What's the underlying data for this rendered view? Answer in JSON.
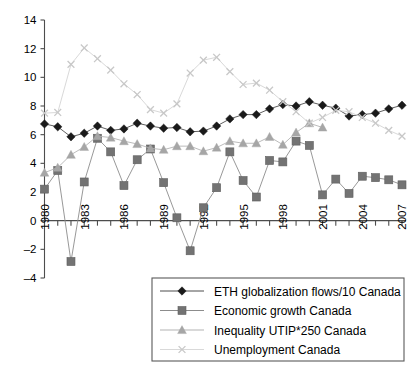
{
  "chart_data": {
    "type": "line",
    "title": "",
    "subtitle": "",
    "xlabel": "",
    "ylabel": "",
    "xlim": [
      1980,
      2007
    ],
    "ylim": [
      -4,
      14
    ],
    "ytick_step": 2,
    "grid": false,
    "legend_position": "bottom-right",
    "yticks": [
      "14",
      "12",
      "10",
      "8",
      "6",
      "4",
      "2",
      "0",
      "–2",
      "–4"
    ],
    "ytick_values": [
      14,
      12,
      10,
      8,
      6,
      4,
      2,
      0,
      -2,
      -4
    ],
    "x": [
      1980,
      1981,
      1982,
      1983,
      1984,
      1985,
      1986,
      1987,
      1988,
      1989,
      1990,
      1991,
      1992,
      1993,
      1994,
      1995,
      1996,
      1997,
      1998,
      1999,
      2000,
      2001,
      2002,
      2003,
      2004,
      2005,
      2006,
      2007
    ],
    "xticks": [
      "1980",
      "1983",
      "1986",
      "1989",
      "1992",
      "1995",
      "1998",
      "2001",
      "2004",
      "2007"
    ],
    "xtick_values": [
      1980,
      1983,
      1986,
      1989,
      1992,
      1995,
      1998,
      2001,
      2004,
      2007
    ],
    "series": [
      {
        "name": "ETH globalization flows/10 Canada",
        "marker": "diamond",
        "color": "#1a1a1a",
        "line_color": "#4d4d4d",
        "values": [
          6.75,
          6.55,
          5.85,
          6.1,
          6.6,
          6.3,
          6.4,
          6.8,
          6.6,
          6.45,
          6.5,
          6.2,
          6.25,
          6.6,
          7.1,
          7.4,
          7.4,
          7.8,
          8.1,
          8.0,
          8.3,
          8.05,
          7.85,
          7.3,
          7.4,
          7.5,
          7.8,
          8.05
        ]
      },
      {
        "name": "Economic growth Canada",
        "marker": "square",
        "color": "#737373",
        "line_color": "#8c8c8c",
        "values": [
          2.2,
          3.5,
          -2.85,
          2.7,
          5.75,
          4.8,
          2.45,
          4.25,
          5.0,
          2.65,
          0.2,
          -2.1,
          0.9,
          2.3,
          4.8,
          2.8,
          1.65,
          4.2,
          4.1,
          5.55,
          5.25,
          1.8,
          2.9,
          1.9,
          3.1,
          3.0,
          2.85,
          2.5
        ]
      },
      {
        "name": "Inequality UTIP*250 Canada",
        "marker": "triangle",
        "color": "#a6a6a6",
        "line_color": "#b3b3b3",
        "values": [
          3.35,
          3.7,
          4.6,
          5.15,
          5.9,
          5.8,
          5.55,
          5.35,
          5.05,
          4.95,
          5.2,
          5.2,
          4.85,
          5.1,
          5.55,
          5.4,
          5.4,
          5.85,
          5.3,
          6.15,
          6.8,
          6.5,
          null,
          null,
          null,
          null,
          null,
          null
        ]
      },
      {
        "name": "Unemployment Canada",
        "marker": "cross",
        "color": "#d9d9d9",
        "line_color": "#d9d9d9",
        "values": [
          7.5,
          7.55,
          10.9,
          12.05,
          11.3,
          10.5,
          9.55,
          8.8,
          7.75,
          7.5,
          8.15,
          10.3,
          11.2,
          11.4,
          10.4,
          9.5,
          9.6,
          9.1,
          8.3,
          7.6,
          6.8,
          7.2,
          7.7,
          7.6,
          7.2,
          6.8,
          6.3,
          5.9
        ]
      }
    ],
    "legend": [
      {
        "label": "ETH globalization flows/10 Canada",
        "marker": "diamond",
        "color": "#1a1a1a"
      },
      {
        "label": "Economic growth Canada",
        "marker": "square",
        "color": "#737373"
      },
      {
        "label": "Inequality UTIP*250 Canada",
        "marker": "triangle",
        "color": "#a6a6a6"
      },
      {
        "label": "Unemployment Canada",
        "marker": "cross",
        "color": "#d9d9d9"
      }
    ]
  }
}
